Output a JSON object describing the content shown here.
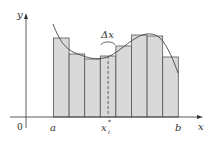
{
  "diagram": {
    "type": "riemann-sum",
    "labels": {
      "y_axis": "y",
      "x_axis": "x",
      "origin": "0",
      "a": "a",
      "b": "b",
      "sample_point": "x",
      "sample_sub": "i",
      "sample_sup": "*",
      "delta": "Δx"
    },
    "colors": {
      "rect_fill": "#d9d9d9",
      "rect_stroke": "#555555",
      "curve": "#444444",
      "axis": "#333333"
    },
    "rectangles": 8
  }
}
